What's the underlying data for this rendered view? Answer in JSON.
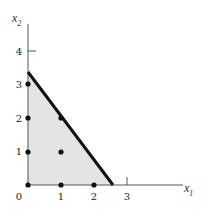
{
  "diagram": {
    "type": "feasible-region-plot",
    "axes": {
      "x_label": "x",
      "x_label_sub": "1",
      "y_label": "x",
      "y_label_sub": "2",
      "x_ticks": [
        "0",
        "1",
        "2",
        "3"
      ],
      "y_ticks": [
        "1",
        "2",
        "3",
        "4"
      ]
    },
    "constraint_line": {
      "x_intercept": 2.55,
      "y_intercept": 3.35
    },
    "integer_points": [
      [
        0,
        0
      ],
      [
        1,
        0
      ],
      [
        2,
        0
      ],
      [
        0,
        1
      ],
      [
        1,
        1
      ],
      [
        0,
        2
      ],
      [
        1,
        2
      ],
      [
        0,
        3
      ]
    ],
    "colors": {
      "region_fill": "#e4e4e4",
      "line": "#111111",
      "axis": "#555555",
      "point": "#111111"
    }
  }
}
